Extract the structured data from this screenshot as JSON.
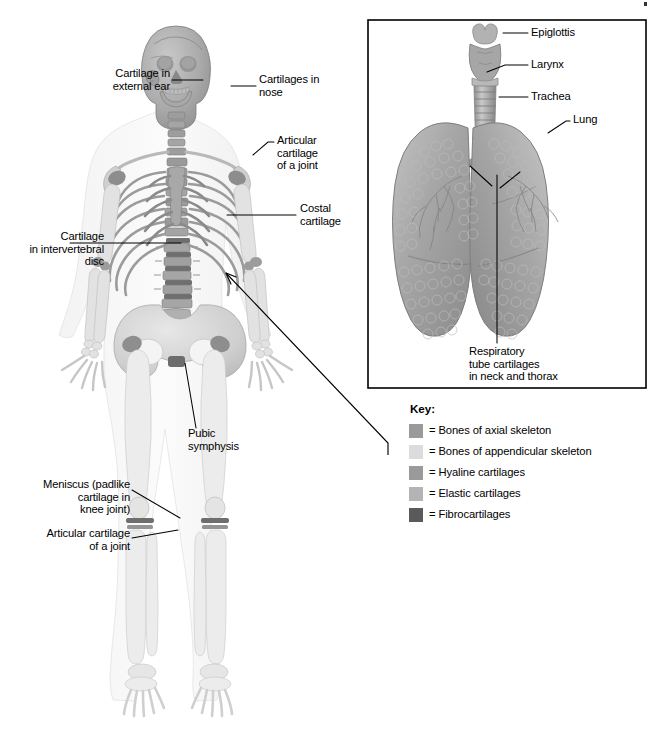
{
  "figure": {
    "type": "anatomical-diagram",
    "background": "#ffffff"
  },
  "body_labels": [
    {
      "id": "cartilage-external-ear",
      "text": "Cartilage in\nexternal ear",
      "align": "right",
      "x": 86,
      "y": 73,
      "w": 84,
      "leader": [
        [
          172,
          80
        ],
        [
          203,
          80
        ]
      ]
    },
    {
      "id": "cartilages-nose",
      "text": "Cartilages in\nnose",
      "align": "left",
      "x": 259,
      "y": 79,
      "w": 90,
      "leader": [
        [
          231,
          86
        ],
        [
          256,
          86
        ]
      ]
    },
    {
      "id": "articular-cartilage-shoulder",
      "text": "Articular\ncartilage\nof a joint",
      "align": "left",
      "x": 276,
      "y": 139,
      "w": 74,
      "leader": [
        [
          253,
          155
        ],
        [
          268,
          142
        ],
        [
          274,
          142
        ]
      ]
    },
    {
      "id": "costal-cartilage",
      "text": "Costal\ncartilage",
      "align": "left",
      "x": 300,
      "y": 207,
      "w": 64,
      "leader": [
        [
          227,
          215
        ],
        [
          296,
          215
        ]
      ]
    },
    {
      "id": "cartilage-intervertebral-disc",
      "text": "Cartilage\nin intervertebral\ndisc",
      "align": "right",
      "x": 12,
      "y": 236,
      "w": 92,
      "leader": [
        [
          70,
          243
        ],
        [
          181,
          243
        ]
      ]
    },
    {
      "id": "pubic-symphysis",
      "text": "Pubic\nsymphysis",
      "align": "left",
      "x": 188,
      "y": 432,
      "w": 70,
      "leader": [
        [
          185,
          363
        ],
        [
          196,
          428
        ]
      ]
    },
    {
      "id": "meniscus-knee",
      "text": "Meniscus (padlike\ncartilage in\nknee joint)",
      "align": "right",
      "x": 27,
      "y": 484,
      "w": 102,
      "leader": [
        [
          132,
          490
        ],
        [
          180,
          518
        ]
      ]
    },
    {
      "id": "articular-cartilage-knee",
      "text": "Articular cartilage\nof a joint",
      "align": "right",
      "x": 28,
      "y": 533,
      "w": 101,
      "leader": [
        [
          132,
          538
        ],
        [
          178,
          530
        ]
      ]
    }
  ],
  "inset": {
    "border_color": "#000000",
    "bounds": {
      "x": 368,
      "y": 20,
      "w": 278,
      "h": 368
    },
    "labels": [
      {
        "id": "epiglottis",
        "text": "Epiglottis",
        "x": 531,
        "y": 27,
        "leader": [
          [
            503,
            33
          ],
          [
            528,
            33
          ]
        ]
      },
      {
        "id": "larynx",
        "text": "Larynx",
        "x": 531,
        "y": 59,
        "leader": [
          [
            487,
            72
          ],
          [
            505,
            65
          ],
          [
            528,
            65
          ]
        ]
      },
      {
        "id": "trachea",
        "text": "Trachea",
        "x": 531,
        "y": 91,
        "leader": [
          [
            499,
            97
          ],
          [
            528,
            97
          ]
        ]
      },
      {
        "id": "lung",
        "text": "Lung",
        "x": 573,
        "y": 114,
        "leader": [
          [
            548,
            133
          ],
          [
            566,
            121
          ],
          [
            570,
            121
          ]
        ]
      },
      {
        "id": "respiratory-tube-cartilages",
        "text": "Respiratory\ntube cartilages\nin neck and thorax",
        "x": 469,
        "y": 347,
        "leader": [
          [
            497,
            175
          ],
          [
            497,
            343
          ]
        ]
      }
    ]
  },
  "connector": {
    "id": "inset-connector",
    "description": "Arrow from inset box to thoracic region of skeleton",
    "path": [
      [
        388,
        455
      ],
      [
        388,
        443
      ],
      [
        225,
        272
      ]
    ],
    "arrow_at": [
      222,
      270
    ]
  },
  "key": {
    "title": "Key:",
    "items": [
      {
        "label": "= Bones of axial skeleton",
        "color": "#9a9a9a"
      },
      {
        "label": "= Bones of appendicular skeleton",
        "color": "#dcdcdc"
      },
      {
        "label": "= Hyaline cartilages",
        "color": "#9a9a9a"
      },
      {
        "label": "= Elastic cartilages",
        "color": "#b4b4b4"
      },
      {
        "label": "= Fibrocartilages",
        "color": "#5a5a5a"
      }
    ]
  }
}
